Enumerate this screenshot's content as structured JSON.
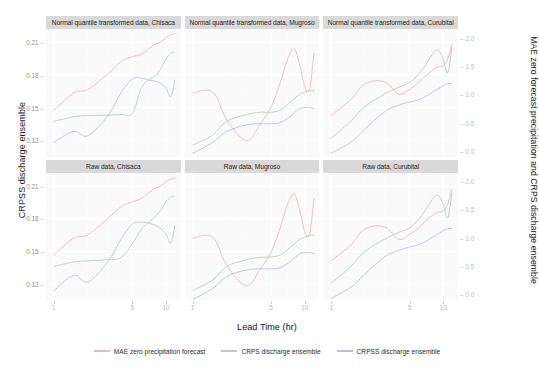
{
  "chart_data": {
    "type": "line",
    "title": "",
    "xlabel": "Lead Time (hr)",
    "ylabel_left": "CRPSS discharge ensemble",
    "ylabel_right": "MAE zero forecast precipitation and CRPS discharge ensemble",
    "x_scale": "log",
    "x_ticks": [
      "1",
      "5",
      "10"
    ],
    "x_tick_values": [
      1,
      5,
      10
    ],
    "xlim": [
      0.85,
      13.5
    ],
    "y_left_ticks": [
      "0.21",
      "0.18",
      "0.15",
      "0.12"
    ],
    "y_left_tick_values": [
      0.21,
      0.18,
      0.15,
      0.12
    ],
    "ylim_left": [
      0.105,
      0.222
    ],
    "y_right_ticks": [
      "2.0",
      "1.5",
      "1.0",
      "0.5",
      "0.0"
    ],
    "y_right_tick_values": [
      2.0,
      1.5,
      1.0,
      0.5,
      0.0
    ],
    "ylim_right": [
      -0.1,
      2.15
    ],
    "grid": true,
    "grid_color": "#ffffff",
    "panel_background": "#fafafa",
    "strip_background": "#d9d9d9",
    "legend_position": "bottom",
    "facet_rows": [
      "Normal quantile transformed data",
      "Raw data"
    ],
    "facet_cols": [
      "Chisaca",
      "Mugroso",
      "Curubital"
    ],
    "series_names": [
      "MAE zero precipitation forecast",
      "CRPS discharge ensemble",
      "CRPSS discharge ensemble"
    ],
    "series_colors": [
      "#e8b9bc",
      "#b8cfc2",
      "#b9c3dd"
    ],
    "panels": [
      {
        "strip": "Normal quantile transformed data, Chisaca",
        "row": 0,
        "col": 0,
        "series": [
          {
            "name": "MAE zero precipitation forecast",
            "color": "#e8b9bc",
            "axis": "right",
            "x": [
              1,
              1.5,
              2,
              3,
              4,
              5,
              6,
              7,
              8,
              9,
              10,
              11,
              12
            ],
            "y": [
              0.72,
              1.02,
              1.08,
              1.35,
              1.58,
              1.66,
              1.7,
              1.8,
              1.88,
              1.92,
              2.0,
              2.05,
              2.07
            ]
          },
          {
            "name": "CRPS discharge ensemble",
            "color": "#b8cfc2",
            "axis": "right",
            "x": [
              1,
              1.5,
              2,
              3,
              4,
              5,
              6,
              7,
              8,
              9,
              10,
              11,
              12
            ],
            "y": [
              0.52,
              0.6,
              0.62,
              0.63,
              0.64,
              0.66,
              1.1,
              1.25,
              1.32,
              1.45,
              1.62,
              1.72,
              1.74
            ]
          },
          {
            "name": "CRPSS discharge ensemble",
            "color": "#b9c3dd",
            "axis": "left",
            "x": [
              1,
              1.5,
              2,
              3,
              4,
              5,
              6,
              7,
              8,
              9,
              10,
              11,
              12
            ],
            "y": [
              0.118,
              0.128,
              0.124,
              0.142,
              0.164,
              0.176,
              0.177,
              0.175,
              0.174,
              0.172,
              0.168,
              0.16,
              0.175
            ]
          }
        ]
      },
      {
        "strip": "Normal quantile transformed data, Mugroso",
        "row": 0,
        "col": 1,
        "series": [
          {
            "name": "MAE zero precipitation forecast",
            "color": "#e8b9bc",
            "axis": "right",
            "x": [
              1,
              1.5,
              2,
              3,
              4,
              5,
              6,
              7,
              8,
              9,
              10,
              11,
              12
            ],
            "y": [
              1.02,
              1.04,
              0.55,
              0.18,
              0.48,
              0.78,
              1.2,
              1.62,
              1.8,
              1.5,
              1.12,
              1.1,
              1.72
            ]
          },
          {
            "name": "CRPS discharge ensemble",
            "color": "#b8cfc2",
            "axis": "right",
            "x": [
              1,
              1.5,
              2,
              3,
              4,
              5,
              6,
              7,
              8,
              9,
              10,
              11,
              12
            ],
            "y": [
              0.1,
              0.28,
              0.52,
              0.64,
              0.68,
              0.68,
              0.72,
              0.82,
              0.92,
              1.0,
              1.04,
              1.06,
              1.06
            ]
          },
          {
            "name": "CRPSS discharge ensemble",
            "color": "#b9c3dd",
            "axis": "left",
            "x": [
              1,
              1.5,
              2,
              3,
              4,
              5,
              6,
              7,
              8,
              9,
              10,
              11,
              12
            ],
            "y": [
              0.108,
              0.118,
              0.128,
              0.134,
              0.135,
              0.135,
              0.136,
              0.14,
              0.145,
              0.149,
              0.15,
              0.15,
              0.149
            ]
          }
        ]
      },
      {
        "strip": "Normal quantile transformed data, Curubital",
        "row": 0,
        "col": 2,
        "series": [
          {
            "name": "MAE zero precipitation forecast",
            "color": "#e8b9bc",
            "axis": "right",
            "x": [
              1,
              1.5,
              2,
              3,
              4,
              5,
              6,
              7,
              8,
              9,
              10,
              11,
              12
            ],
            "y": [
              0.62,
              0.9,
              1.18,
              1.22,
              1.0,
              1.08,
              1.2,
              1.32,
              1.42,
              1.48,
              1.5,
              1.62,
              1.88
            ]
          },
          {
            "name": "CRPS discharge ensemble",
            "color": "#b8cfc2",
            "axis": "right",
            "x": [
              1,
              1.5,
              2,
              3,
              4,
              5,
              6,
              7,
              8,
              9,
              10,
              11,
              12
            ],
            "y": [
              0.22,
              0.52,
              0.78,
              1.0,
              1.12,
              1.2,
              1.34,
              1.52,
              1.7,
              1.78,
              1.62,
              1.38,
              1.82
            ]
          },
          {
            "name": "CRPSS discharge ensemble",
            "color": "#b9c3dd",
            "axis": "left",
            "x": [
              1,
              1.5,
              2,
              3,
              4,
              5,
              6,
              7,
              8,
              9,
              10,
              11,
              12
            ],
            "y": [
              0.108,
              0.118,
              0.13,
              0.146,
              0.152,
              0.155,
              0.157,
              0.16,
              0.164,
              0.167,
              0.17,
              0.172,
              0.172
            ]
          }
        ]
      },
      {
        "strip": "Raw data, Chisaca",
        "row": 1,
        "col": 0,
        "series": [
          {
            "name": "MAE zero precipitation forecast",
            "color": "#e8b9bc",
            "axis": "right",
            "x": [
              1,
              1.5,
              2,
              3,
              4,
              5,
              6,
              7,
              8,
              9,
              10,
              11,
              12
            ],
            "y": [
              0.7,
              1.0,
              1.06,
              1.34,
              1.56,
              1.64,
              1.7,
              1.8,
              1.88,
              1.92,
              2.0,
              2.04,
              2.06
            ]
          },
          {
            "name": "CRPS discharge ensemble",
            "color": "#b8cfc2",
            "axis": "right",
            "x": [
              1,
              1.5,
              2,
              3,
              4,
              5,
              6,
              7,
              8,
              9,
              10,
              11,
              12
            ],
            "y": [
              0.5,
              0.58,
              0.6,
              0.62,
              0.66,
              0.9,
              1.15,
              1.28,
              1.38,
              1.5,
              1.64,
              1.72,
              1.74
            ]
          },
          {
            "name": "CRPSS discharge ensemble",
            "color": "#b9c3dd",
            "axis": "left",
            "x": [
              1,
              1.5,
              2,
              3,
              4,
              5,
              6,
              7,
              8,
              9,
              10,
              11,
              12
            ],
            "y": [
              0.114,
              0.128,
              0.122,
              0.14,
              0.162,
              0.175,
              0.177,
              0.176,
              0.174,
              0.171,
              0.166,
              0.158,
              0.174
            ]
          }
        ]
      },
      {
        "strip": "Raw data, Mugroso",
        "row": 1,
        "col": 1,
        "series": [
          {
            "name": "MAE zero precipitation forecast",
            "color": "#e8b9bc",
            "axis": "right",
            "x": [
              1,
              1.5,
              2,
              3,
              4,
              5,
              6,
              7,
              8,
              9,
              10,
              11,
              12
            ],
            "y": [
              1.0,
              1.02,
              0.52,
              0.16,
              0.46,
              0.76,
              1.18,
              1.6,
              1.78,
              1.48,
              1.1,
              1.08,
              1.7
            ]
          },
          {
            "name": "CRPS discharge ensemble",
            "color": "#b8cfc2",
            "axis": "right",
            "x": [
              1,
              1.5,
              2,
              3,
              4,
              5,
              6,
              7,
              8,
              9,
              10,
              11,
              12
            ],
            "y": [
              0.08,
              0.26,
              0.5,
              0.62,
              0.66,
              0.67,
              0.7,
              0.8,
              0.9,
              0.98,
              1.02,
              1.05,
              1.05
            ]
          },
          {
            "name": "CRPSS discharge ensemble",
            "color": "#b9c3dd",
            "axis": "left",
            "x": [
              1,
              1.5,
              2,
              3,
              4,
              5,
              6,
              7,
              8,
              9,
              10,
              11,
              12
            ],
            "y": [
              0.106,
              0.116,
              0.127,
              0.133,
              0.134,
              0.134,
              0.135,
              0.139,
              0.144,
              0.148,
              0.149,
              0.149,
              0.148
            ]
          }
        ]
      },
      {
        "strip": "Raw data, Curubital",
        "row": 1,
        "col": 2,
        "series": [
          {
            "name": "MAE zero precipitation forecast",
            "color": "#e8b9bc",
            "axis": "right",
            "x": [
              1,
              1.5,
              2,
              3,
              4,
              5,
              6,
              7,
              8,
              9,
              10,
              11,
              12
            ],
            "y": [
              0.6,
              0.88,
              1.16,
              1.2,
              0.98,
              1.06,
              1.18,
              1.3,
              1.4,
              1.46,
              1.48,
              1.6,
              1.86
            ]
          },
          {
            "name": "CRPS discharge ensemble",
            "color": "#b8cfc2",
            "axis": "right",
            "x": [
              1,
              1.5,
              2,
              3,
              4,
              5,
              6,
              7,
              8,
              9,
              10,
              11,
              12
            ],
            "y": [
              0.2,
              0.5,
              0.76,
              0.98,
              1.1,
              1.18,
              1.32,
              1.5,
              1.68,
              1.76,
              1.6,
              1.36,
              1.8
            ]
          },
          {
            "name": "CRPSS discharge ensemble",
            "color": "#b9c3dd",
            "axis": "left",
            "x": [
              1,
              1.5,
              2,
              3,
              4,
              5,
              6,
              7,
              8,
              9,
              10,
              11,
              12
            ],
            "y": [
              0.107,
              0.117,
              0.129,
              0.145,
              0.151,
              0.154,
              0.156,
              0.159,
              0.163,
              0.166,
              0.169,
              0.171,
              0.171
            ]
          }
        ]
      }
    ]
  }
}
